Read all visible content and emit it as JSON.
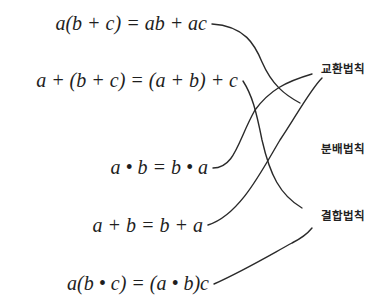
{
  "diagram": {
    "type": "matching",
    "equations": [
      {
        "id": "eq1",
        "text": "a(b + c) = ab + ac",
        "matches": "분배법칙"
      },
      {
        "id": "eq2",
        "text": "a + (b + c) = (a + b) + c",
        "matches": "결합법칙"
      },
      {
        "id": "eq3",
        "text": "a • b = b • a",
        "matches": "교환법칙"
      },
      {
        "id": "eq4",
        "text": "a + b = b + a",
        "matches": "교환법칙"
      },
      {
        "id": "eq5",
        "text": "a(b • c) = (a • b)c",
        "matches": "결합법칙"
      }
    ],
    "laws": [
      {
        "id": "law1",
        "label": "교환법칙"
      },
      {
        "id": "law2",
        "label": "분배법칙"
      },
      {
        "id": "law3",
        "label": "결합법칙"
      }
    ],
    "colors": {
      "line": "#2a2a2a",
      "text": "#1e1e1e",
      "background": "#ffffff"
    }
  }
}
